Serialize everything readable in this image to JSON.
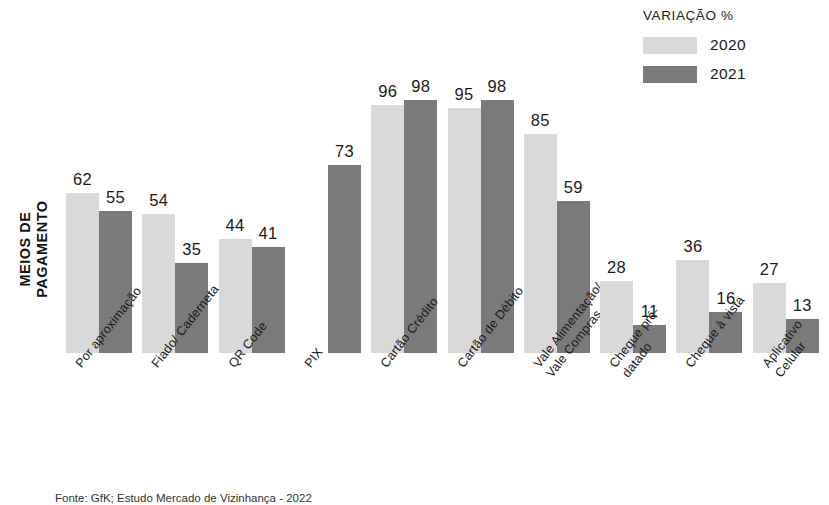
{
  "legend": {
    "title": "VARIAÇÃO %",
    "entries": [
      {
        "label": "2020",
        "color": "#d9d9d9"
      },
      {
        "label": "2021",
        "color": "#7a7a7a"
      }
    ]
  },
  "axis": {
    "y_title": "MEIOS DE\nPAGAMENTO"
  },
  "footer": {
    "source": "Fonte: GfK; Estudo Mercado de Vizinhança - 2022"
  },
  "chart_data": {
    "type": "bar",
    "title": "",
    "subtitle": "",
    "xlabel": "",
    "ylabel": "MEIOS DE PAGAMENTO",
    "legend_title": "VARIAÇÃO %",
    "legend_position": "top-right",
    "grid": false,
    "axis_visible": false,
    "ylim": [
      0,
      100
    ],
    "value_unit": "%",
    "categories": [
      "Por aproximação",
      "Fiado/ Caderneta",
      "QR Code",
      "PIX",
      "Cartão Crédito",
      "Cartão de Débito",
      "Vale Alimentação/\nVale Compras",
      "Cheque pré-\ndatado",
      "Cheque à vista",
      "Aplicativo Celular"
    ],
    "series": [
      {
        "name": "2020",
        "color": "#d9d9d9",
        "values": [
          62,
          54,
          44,
          null,
          96,
          95,
          85,
          28,
          36,
          27
        ]
      },
      {
        "name": "2021",
        "color": "#7a7a7a",
        "values": [
          55,
          35,
          41,
          73,
          98,
          98,
          59,
          11,
          16,
          13
        ]
      }
    ]
  }
}
